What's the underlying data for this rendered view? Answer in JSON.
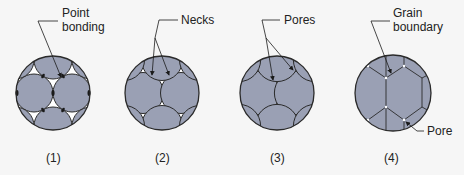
{
  "diagram": {
    "colors": {
      "background": "#f6f6f6",
      "particle_fill": "#9aa0b4",
      "outline": "#2a2a2a",
      "pore": "#ffffff",
      "text": "#222222"
    },
    "stages": [
      {
        "id": 1,
        "caption": "(1)",
        "annotation_lines": [
          "Point",
          "bonding"
        ]
      },
      {
        "id": 2,
        "caption": "(2)",
        "annotation_lines": [
          "Necks"
        ]
      },
      {
        "id": 3,
        "caption": "(3)",
        "annotation_lines": [
          "Pores"
        ]
      },
      {
        "id": 4,
        "caption": "(4)",
        "annotation_lines": [
          "Grain",
          "boundary"
        ],
        "secondary_annotation": "Pore"
      }
    ]
  }
}
